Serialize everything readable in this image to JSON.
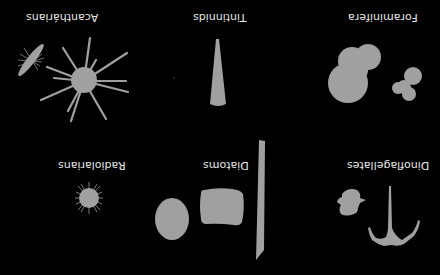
{
  "figure": {
    "orientation": "rotated 180 degrees",
    "background_color": "#000000",
    "shape_color": "#a0a0a0",
    "label_color": "#e6e6e6",
    "panels": [
      {
        "id": "acantharians",
        "label": "Acanthárians"
      },
      {
        "id": "tintinnids",
        "label": "Tintinnids"
      },
      {
        "id": "foraminifera",
        "label": "Foraminifera"
      },
      {
        "id": "radiolarians",
        "label": "Radiolarians"
      },
      {
        "id": "diatoms",
        "label": "Diatoms"
      },
      {
        "id": "dinoflagellates",
        "label": "Dinoflagellates"
      }
    ]
  }
}
